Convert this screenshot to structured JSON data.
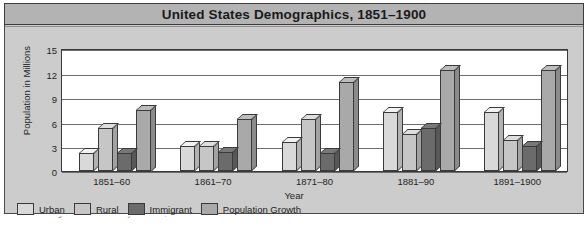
{
  "header": {
    "title": "United States  Demographics, 1851–1900"
  },
  "colors": {
    "urban": "#d9d9d9",
    "rural": "#c6c6c6",
    "immigrant": "#6b6b6b",
    "population_growth": "#a9a9a9",
    "frame": "#c9c9c9",
    "title_bar": "#b3b3b3",
    "panel": "#cccccc",
    "plot_bg": "#ffffff",
    "axis": "#3a3a3a",
    "grid": "#6d6d6d",
    "text": "#1f1f1f"
  },
  "legend": {
    "items": [
      {
        "label": "Urban",
        "color": "#d9d9d9"
      },
      {
        "label": "Rural",
        "color": "#c6c6c6"
      },
      {
        "label": "Immigrant",
        "color": "#6b6b6b"
      },
      {
        "label": "Population Growth",
        "color": "#a9a9a9"
      }
    ]
  },
  "footer": {
    "source": "Source: Carnegie Mellon University Libraries, United States Historical Census Data"
  },
  "chart_data": {
    "type": "bar",
    "title": "United States  Demographics, 1851–1900",
    "xlabel": "Year",
    "ylabel": "Population in Millions",
    "categories": [
      "1851–60",
      "1861–70",
      "1871–80",
      "1881–90",
      "1891–1900"
    ],
    "ylim": [
      0,
      15
    ],
    "yticks": [
      0,
      3,
      6,
      9,
      12,
      15
    ],
    "grid": true,
    "legend_position": "bottom-left",
    "series": [
      {
        "name": "Urban",
        "color": "#d9d9d9",
        "values": [
          2.2,
          3.0,
          3.5,
          7.2,
          7.2
        ]
      },
      {
        "name": "Rural",
        "color": "#c6c6c6",
        "values": [
          5.2,
          3.0,
          6.3,
          4.5,
          3.8
        ]
      },
      {
        "name": "Immigrant",
        "color": "#6b6b6b",
        "values": [
          2.2,
          2.3,
          2.2,
          5.2,
          3.0
        ]
      },
      {
        "name": "Population Growth",
        "color": "#a9a9a9",
        "values": [
          7.5,
          6.3,
          10.8,
          12.3,
          12.3
        ]
      }
    ]
  }
}
